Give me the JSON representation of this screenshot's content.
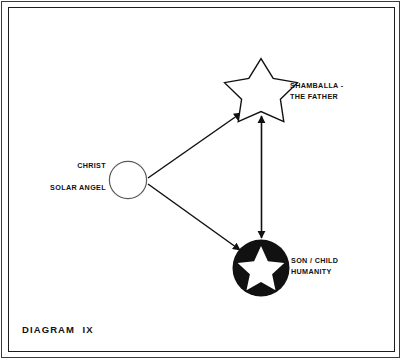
{
  "plate": {
    "caption": "DIAGRAM  IX",
    "background_color": "#ffffff",
    "ink_color": "#111111"
  },
  "nodes": {
    "shamballa": {
      "label_line1": "SHAMBALLA -",
      "label_line2": "THE FATHER",
      "shape": "outline-star",
      "fill": "#ffffff",
      "stroke": "#111111",
      "center_x": 261,
      "center_y": 90
    },
    "christ": {
      "label_line1": "CHRIST",
      "label_line2": "SOLAR ANGEL",
      "shape": "outline-circle",
      "fill": "#ffffff",
      "stroke": "#555555",
      "center_x": 128,
      "center_y": 180,
      "radius": 19
    },
    "son": {
      "label_line1": "SON / CHILD",
      "label_line2": "HUMANITY",
      "shape": "filled-circle-with-white-star",
      "fill": "#111111",
      "star_fill": "#ffffff",
      "center_x": 261,
      "center_y": 268,
      "radius": 28
    }
  },
  "connectors": [
    {
      "name": "christ-to-shamballa",
      "from": "christ",
      "to": "shamballa",
      "arrowheads": "end"
    },
    {
      "name": "christ-to-son",
      "from": "christ",
      "to": "son",
      "arrowheads": "end"
    },
    {
      "name": "shamballa-to-son",
      "from": "shamballa",
      "to": "son",
      "arrowheads": "both"
    }
  ]
}
